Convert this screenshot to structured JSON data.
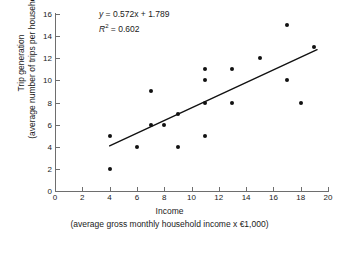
{
  "chart_data": {
    "type": "scatter",
    "title": "",
    "xlabel": "Income",
    "xlabel_sub": "(average gross monthly household income x €1,000)",
    "ylabel": "Trip generation",
    "ylabel_sub": "(average number of trips per household)",
    "xlim": [
      0,
      20
    ],
    "ylim": [
      0,
      16
    ],
    "xticks": [
      0,
      2,
      4,
      6,
      8,
      10,
      12,
      14,
      16,
      18,
      20
    ],
    "yticks": [
      0,
      2,
      4,
      6,
      8,
      10,
      12,
      14,
      16
    ],
    "grid": false,
    "legend": false,
    "point_color": "#111111",
    "axis_color": "#6e6e6e",
    "line_color": "#111111",
    "points": [
      {
        "x": 4,
        "y": 5
      },
      {
        "x": 4,
        "y": 2
      },
      {
        "x": 6,
        "y": 4
      },
      {
        "x": 7,
        "y": 9
      },
      {
        "x": 7,
        "y": 6
      },
      {
        "x": 8,
        "y": 6
      },
      {
        "x": 9,
        "y": 7
      },
      {
        "x": 9,
        "y": 4
      },
      {
        "x": 11,
        "y": 11
      },
      {
        "x": 11,
        "y": 10
      },
      {
        "x": 11,
        "y": 8
      },
      {
        "x": 11,
        "y": 5
      },
      {
        "x": 13,
        "y": 11
      },
      {
        "x": 13,
        "y": 8
      },
      {
        "x": 15,
        "y": 12
      },
      {
        "x": 17,
        "y": 15
      },
      {
        "x": 17,
        "y": 10
      },
      {
        "x": 18,
        "y": 8
      },
      {
        "x": 19,
        "y": 13
      }
    ],
    "trendline": {
      "slope": 0.572,
      "intercept": 1.789,
      "x_start": 4.0,
      "x_end": 19.2,
      "y_start": 4.08,
      "y_end": 12.77
    },
    "annotations": {
      "equation_y": "y",
      "equation_rest": " = 0.572x + 1.789",
      "r2_symbol": "R",
      "r2_sup": "2",
      "r2_rest": " = 0.602",
      "r_squared_value": 0.602
    }
  }
}
